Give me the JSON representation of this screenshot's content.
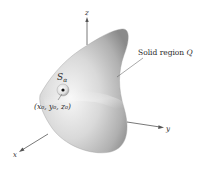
{
  "diagram": {
    "axes": {
      "x_label": "x",
      "y_label": "y",
      "z_label": "z"
    },
    "region_label": "Solid region Q",
    "region_label_main": "Solid region ",
    "region_label_var": "Q",
    "sphere_label": "S",
    "sphere_label_sub": "α",
    "point_label": "(x₀, y₀, z₀)",
    "colors": {
      "solid_light": "#f2f2f2",
      "solid_mid": "#c8c8c8",
      "solid_dark": "#8e8e8e",
      "axis": "#555555",
      "text": "#2a2a2a"
    }
  }
}
